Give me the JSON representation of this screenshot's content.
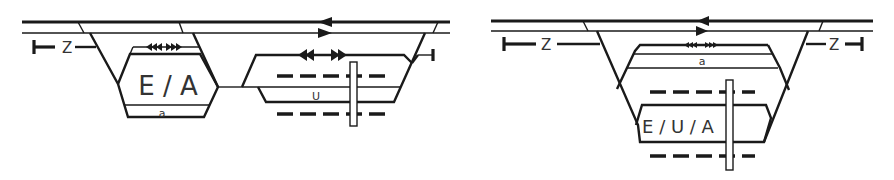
{
  "diagrams": [
    {
      "id": "left",
      "platform_label": "E / A",
      "track_label_a": "a",
      "track_label_u": "U",
      "stub_label": "Z"
    },
    {
      "id": "right",
      "platform_label": "E / U / A",
      "track_label_a": "a",
      "stub_label_left": "Z",
      "stub_label_right": "Z"
    }
  ],
  "colors": {
    "line": "#1a1a1a",
    "text": "#333333",
    "background": "#ffffff"
  }
}
